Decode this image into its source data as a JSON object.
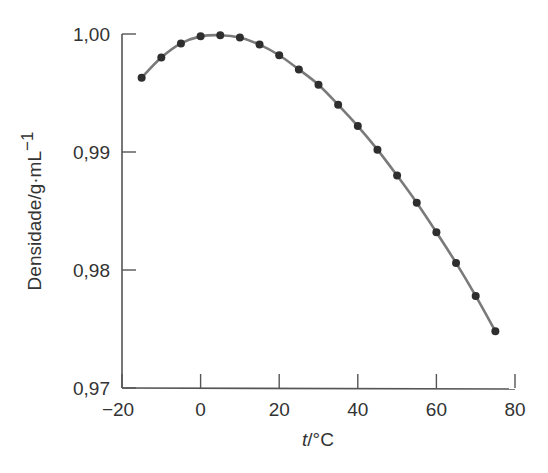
{
  "chart_data": {
    "type": "line",
    "title": "",
    "xlabel": "t/°C",
    "xlabel_italic_part": "t",
    "xlabel_rest": "/°C",
    "ylabel": "Densidade/g·mL⁻¹",
    "ylabel_main": "Densidade/g·mL",
    "ylabel_sup": "−1",
    "xlim": [
      -20,
      80
    ],
    "ylim": [
      0.97,
      1.0
    ],
    "x_ticks": [
      -20,
      0,
      20,
      40,
      60,
      80
    ],
    "x_tick_labels": [
      "−20",
      "0",
      "20",
      "40",
      "60",
      "80"
    ],
    "y_ticks": [
      0.97,
      0.98,
      0.99,
      1.0
    ],
    "y_tick_labels": [
      "0,97",
      "0,98",
      "0,99",
      "1,00"
    ],
    "grid": false,
    "legend": null,
    "series": [
      {
        "name": "Densidade da água",
        "marker": "circle",
        "line": "smooth",
        "x": [
          -15,
          -10,
          -5,
          0,
          5,
          10,
          15,
          20,
          25,
          30,
          35,
          40,
          45,
          50,
          55,
          60,
          65,
          70,
          75
        ],
        "y": [
          0.9963,
          0.998,
          0.9992,
          0.9998,
          0.9999,
          0.9997,
          0.9991,
          0.9982,
          0.997,
          0.9957,
          0.994,
          0.9922,
          0.9902,
          0.988,
          0.9857,
          0.9832,
          0.9806,
          0.9778,
          0.9748
        ]
      }
    ]
  },
  "colors": {
    "axis": "#555555",
    "line": "#7a7a7a",
    "marker": "#2e2e2e",
    "text": "#333333"
  }
}
